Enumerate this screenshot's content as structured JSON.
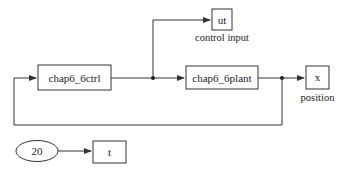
{
  "diagram": {
    "type": "simulink-block-diagram",
    "blocks": {
      "controller": {
        "label": "chap6_6ctrl",
        "kind": "s-function"
      },
      "plant": {
        "label": "chap6_6plant",
        "kind": "s-function"
      },
      "ut_out": {
        "label": "ut",
        "caption": "control input",
        "kind": "to-workspace"
      },
      "x_out": {
        "label": "x",
        "caption": "position",
        "kind": "to-workspace"
      },
      "clock": {
        "label": "20",
        "kind": "clock"
      },
      "t_out": {
        "label": "t",
        "kind": "to-workspace"
      }
    },
    "connections": [
      {
        "from": "controller",
        "to": "plant"
      },
      {
        "from": "controller",
        "to": "ut_out"
      },
      {
        "from": "plant",
        "to": "x_out"
      },
      {
        "from": "plant",
        "to": "controller",
        "note": "feedback"
      },
      {
        "from": "clock",
        "to": "t_out"
      }
    ],
    "colors": {
      "line": "#333333",
      "background": "#ffffff"
    }
  }
}
